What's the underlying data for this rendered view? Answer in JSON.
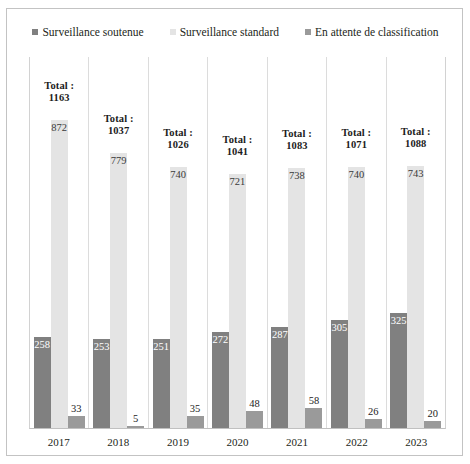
{
  "top_clip": {
    "fragments": [
      "",
      "",
      ""
    ]
  },
  "chart_data": {
    "type": "bar",
    "title": "",
    "subtitle": "",
    "xlabel": "",
    "ylabel": "",
    "grid": false,
    "legend_position": "top-center",
    "axis_visible": {
      "x": true,
      "y": false
    },
    "ylim": [
      0,
      900
    ],
    "categories": [
      "2017",
      "2018",
      "2019",
      "2020",
      "2021",
      "2022",
      "2023"
    ],
    "series": [
      {
        "name": "Surveillance soutenue",
        "color": "#808080",
        "label_color": "#ffffff",
        "label_position": "inside",
        "values": [
          258,
          253,
          251,
          272,
          287,
          305,
          325
        ]
      },
      {
        "name": "Surveillance standard",
        "color": "#e4e4e4",
        "label_color": "#3a3a3a",
        "label_position": "inside",
        "values": [
          872,
          779,
          740,
          721,
          738,
          740,
          743
        ]
      },
      {
        "name": "En attente de classification",
        "color": "#9a9a9a",
        "label_color": "#1c1c1c",
        "label_position": "above",
        "values": [
          33,
          5,
          35,
          48,
          58,
          26,
          20
        ]
      }
    ],
    "annotations": {
      "prefix": "Total :",
      "totals": [
        1163,
        1037,
        1026,
        1041,
        1083,
        1071,
        1088
      ]
    }
  },
  "colors": {
    "series_1": "#808080",
    "series_2": "#e4e4e4",
    "series_3": "#9a9a9a",
    "frame_border": "#c3c3c3",
    "gridline": "#dcdcdc",
    "text": "#231f20",
    "background": "#ffffff"
  }
}
